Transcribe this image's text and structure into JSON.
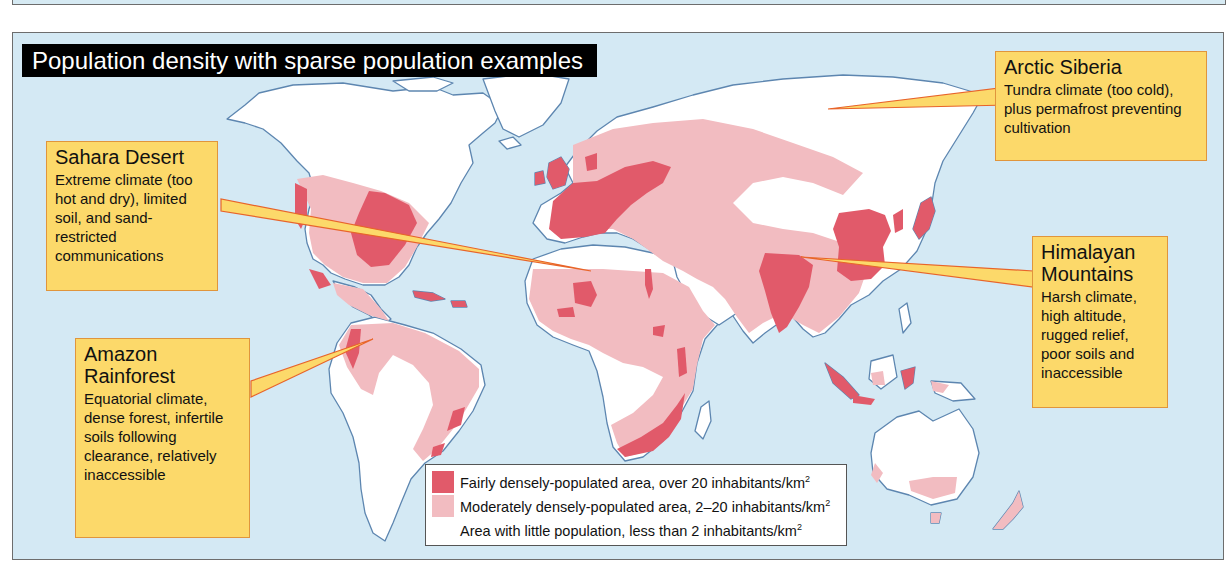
{
  "map": {
    "title": "Population density with sparse population examples",
    "colors": {
      "ocean": "#d4e9f4",
      "coast": "#5d86b0",
      "dense": "#e15a6a",
      "moderate": "#f2bcc1",
      "sparse": "#ffffff",
      "callout_fill": "#fcd96a",
      "callout_border": "#e0953c",
      "pointer_line": "#e8642a"
    }
  },
  "callouts": [
    {
      "id": "arctic-siberia",
      "title": "Arctic Siberia",
      "body": "Tundra climate (too cold), plus permafrost preventing cultivation"
    },
    {
      "id": "sahara-desert",
      "title": "Sahara Desert",
      "body": "Extreme climate (too hot and dry), limited soil, and sand-restricted communications"
    },
    {
      "id": "amazon-rainforest",
      "title": "Amazon Rainforest",
      "body": "Equatorial climate, dense forest, infertile soils following clearance, relatively inaccessible"
    },
    {
      "id": "himalayan-mountains",
      "title": "Himalayan Mountains",
      "body": "Harsh climate, high altitude, rugged relief, poor soils and inaccessible"
    }
  ],
  "legend": {
    "items": [
      {
        "label": "Fairly densely-populated area, over 20 inhabitants/km",
        "sup": "2",
        "color": "#e15a6a"
      },
      {
        "label": "Moderately densely-populated area, 2–20 inhabitants/km",
        "sup": "2",
        "color": "#f2bcc1"
      },
      {
        "label": "Area with little population, less than 2 inhabitants/km",
        "sup": "2",
        "color": "#ffffff"
      }
    ]
  }
}
